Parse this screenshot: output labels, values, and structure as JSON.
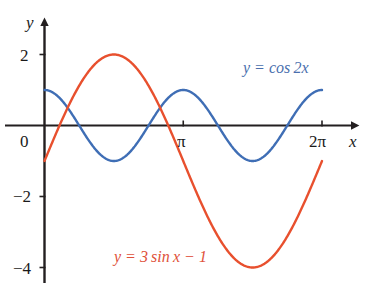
{
  "figure": {
    "background_color": "#ffffff",
    "axis_color": "#231f20"
  },
  "axes": {
    "x_axis_name": "x",
    "y_axis_name": "y",
    "x_ticks": [
      {
        "label": "π",
        "value": 3.14159265
      },
      {
        "label": "2π",
        "value": 6.28318531
      }
    ],
    "y_ticks": [
      {
        "label": "2",
        "value": 2
      },
      {
        "label": "0",
        "value": 0
      },
      {
        "label": "−2",
        "value": -2
      },
      {
        "label": "−4",
        "value": -4
      }
    ],
    "xlim": [
      -0.25,
      6.95
    ],
    "ylim": [
      -4.55,
      2.65
    ],
    "grid": false,
    "origin_label": "0"
  },
  "chart_data": {
    "type": "line",
    "title": "",
    "subtitle": "",
    "xlabel": "x",
    "ylabel": "y",
    "xlim": [
      -0.25,
      6.95
    ],
    "ylim": [
      -4.55,
      2.65
    ],
    "grid": false,
    "legend_position": "inline-annotations",
    "xtick_labels": [
      "π",
      "2π"
    ],
    "xtick_values": [
      3.14159265,
      6.28318531
    ],
    "ytick_labels": [
      "2",
      "0",
      "−2",
      "−4"
    ],
    "ytick_values": [
      2,
      0,
      -2,
      -4
    ],
    "x": [
      0,
      0.3141593,
      0.6283185,
      0.9424778,
      1.2566371,
      1.5707963,
      1.8849556,
      2.1991149,
      2.5132741,
      2.8274334,
      3.1415927,
      3.4557519,
      3.7699112,
      4.0840704,
      4.3982297,
      4.712389,
      5.0265482,
      5.3407075,
      5.6548668,
      5.969026,
      6.2831853
    ],
    "series": [
      {
        "name": "y = cos 2x",
        "expression": "cos(2x)",
        "color": "#3f6eb5",
        "amplitude": 1,
        "frequency": 2,
        "vertical_shift": 0,
        "domain": [
          0,
          6.28318531
        ],
        "values": [
          1,
          0.809,
          0.309,
          -0.309,
          -0.809,
          -1,
          -0.809,
          -0.309,
          0.309,
          0.809,
          1,
          0.809,
          0.309,
          -0.309,
          -0.809,
          -1,
          -0.809,
          -0.309,
          0.309,
          0.809,
          1
        ],
        "label": "y = cos 2x",
        "label_parts": {
          "lhs": "y",
          "eq": "=",
          "rhs": "cos 2x"
        },
        "maxima": [
          {
            "x": 0,
            "y": 1
          },
          {
            "x": 3.14159265,
            "y": 1
          },
          {
            "x": 6.28318531,
            "y": 1
          }
        ],
        "minima": [
          {
            "x": 1.57079633,
            "y": -1
          },
          {
            "x": 4.71238898,
            "y": -1
          }
        ]
      },
      {
        "name": "y = 3 sin x − 1",
        "expression": "3*sin(x) - 1",
        "color": "#e8502e",
        "amplitude": 3,
        "frequency": 1,
        "vertical_shift": -1,
        "domain": [
          0,
          6.28318531
        ],
        "values": [
          -1,
          -0.073,
          0.763,
          1.427,
          1.853,
          2,
          1.853,
          1.427,
          0.763,
          -0.073,
          -1,
          -1.927,
          -2.763,
          -3.427,
          -3.853,
          -4,
          -3.853,
          -3.427,
          -2.763,
          -1.927,
          -1
        ],
        "label": "y = 3 sin x − 1",
        "label_parts": {
          "lhs": "y",
          "eq": "=",
          "rhs": "3 sin x",
          "minus": "−",
          "constant": "1"
        },
        "maxima": [
          {
            "x": 1.57079633,
            "y": 2
          }
        ],
        "minima": [
          {
            "x": 4.71238898,
            "y": -4
          }
        ],
        "endpoints": [
          {
            "x": 0,
            "y": -1
          },
          {
            "x": 6.28318531,
            "y": -1
          }
        ]
      }
    ]
  },
  "annotations": [
    {
      "id": "cos-label",
      "text": "y = cos 2x",
      "color": "#4a6fae"
    },
    {
      "id": "sin-label",
      "text": "y = 3 sin x − 1",
      "color": "#e0513a"
    }
  ]
}
